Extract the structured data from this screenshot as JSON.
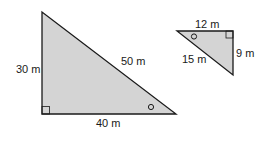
{
  "diagram": {
    "fill_color": "#d4d4d4",
    "stroke_color": "#1a1a1a",
    "large_triangle": {
      "vertical_side": "30 m",
      "hypotenuse": "50 m",
      "base": "40 m"
    },
    "small_triangle": {
      "top_side": "12 m",
      "vertical_side": "9 m",
      "hypotenuse": "15 m"
    }
  }
}
